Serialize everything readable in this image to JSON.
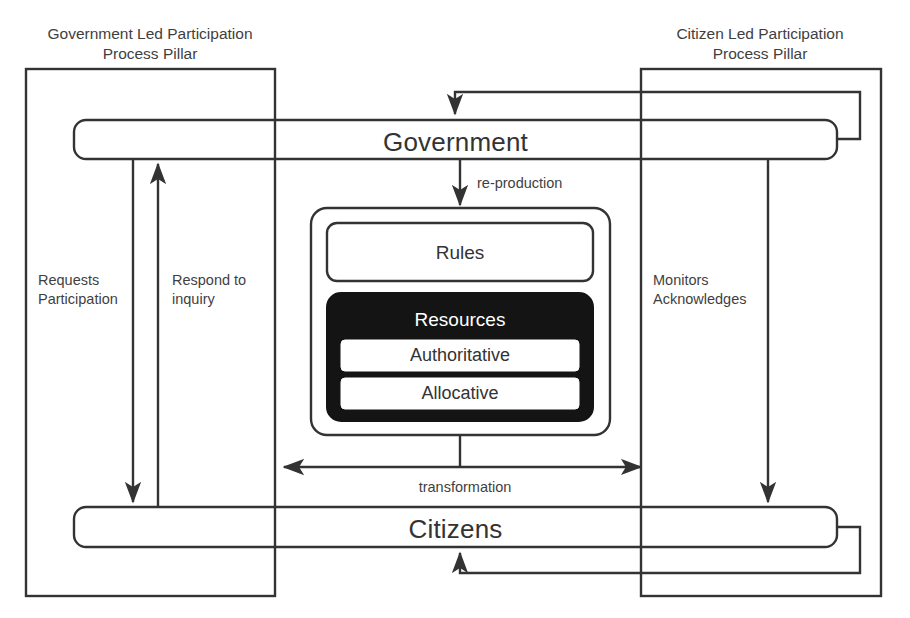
{
  "diagram": {
    "colors": {
      "line": "#333333",
      "text": "#3f3f3f",
      "resources_fill": "#141414",
      "resources_text": "#ffffff",
      "background": "#ffffff"
    },
    "pillars": [
      {
        "id": "government-led",
        "label": "Government Led Participation\nProcess Pillar"
      },
      {
        "id": "citizen-led",
        "label": "Citizen Led Participation\nProcess Pillar"
      }
    ],
    "actors": [
      {
        "id": "government",
        "label": "Government"
      },
      {
        "id": "citizens",
        "label": "Citizens"
      }
    ],
    "structure": {
      "rules": {
        "label": "Rules"
      },
      "resources": {
        "label": "Resources",
        "items": [
          {
            "label": "Authoritative"
          },
          {
            "label": "Allocative"
          }
        ]
      }
    },
    "flows": [
      {
        "id": "re-production",
        "label": "re-production",
        "direction": "down",
        "from": "government",
        "to": "structure"
      },
      {
        "id": "transformation",
        "label": "transformation",
        "direction": "both",
        "from": "government-pillar",
        "to": "citizen-pillar"
      },
      {
        "id": "requests-participation",
        "label": "Requests\nParticipation",
        "direction": "down",
        "from": "government",
        "to": "citizens"
      },
      {
        "id": "respond-to-inquiry",
        "label": "Respond to\ninquiry",
        "direction": "up",
        "from": "citizens",
        "to": "government"
      },
      {
        "id": "monitors-acknowledges",
        "label": "Monitors\nAcknowledges",
        "direction": "down",
        "from": "government",
        "to": "citizens"
      }
    ]
  }
}
